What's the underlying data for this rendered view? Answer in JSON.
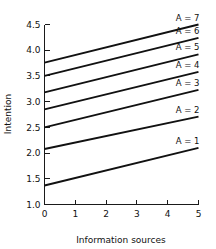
{
  "chart_data": {
    "type": "line",
    "title": "",
    "xlabel": "Information sources",
    "ylabel": "Intention",
    "xlim": [
      0,
      5
    ],
    "ylim": [
      1.0,
      4.5
    ],
    "grid": false,
    "legend_position": "inline-right-above-line-end",
    "xticks": [
      0,
      1,
      2,
      3,
      4,
      5
    ],
    "xtick_labels": [
      "0",
      "1",
      "2",
      "3",
      "4",
      "5"
    ],
    "yticks": [
      1.0,
      1.5,
      2.0,
      2.5,
      3.0,
      3.5,
      4.0,
      4.5
    ],
    "ytick_labels": [
      "1.0",
      "1.5",
      "2.0",
      "2.5",
      "3.0",
      "3.5",
      "4.0",
      "4.5"
    ],
    "x": [
      0,
      5
    ],
    "series": [
      {
        "name": "A = 1",
        "values": [
          1.37,
          2.1
        ]
      },
      {
        "name": "A = 2",
        "values": [
          2.08,
          2.71
        ]
      },
      {
        "name": "A = 3",
        "values": [
          2.5,
          3.23
        ]
      },
      {
        "name": "A = 4",
        "values": [
          2.85,
          3.58
        ]
      },
      {
        "name": "A = 5",
        "values": [
          3.18,
          3.92
        ]
      },
      {
        "name": "A = 6",
        "values": [
          3.5,
          4.24
        ]
      },
      {
        "name": "A = 7",
        "values": [
          3.76,
          4.5
        ]
      }
    ],
    "annotations": [
      {
        "text": "A = 7",
        "x": 5,
        "y": 4.5
      },
      {
        "text": "A = 6",
        "x": 5,
        "y": 4.24
      },
      {
        "text": "A = 5",
        "x": 5,
        "y": 3.92
      },
      {
        "text": "A = 4",
        "x": 5,
        "y": 3.58
      },
      {
        "text": "A = 3",
        "x": 5,
        "y": 3.23
      },
      {
        "text": "A = 2",
        "x": 5,
        "y": 2.71
      },
      {
        "text": "A = 1",
        "x": 5,
        "y": 2.1
      }
    ],
    "colors": {
      "line": "#111111",
      "axis": "#1a1a1a",
      "text": "#111111",
      "background": "#ffffff"
    }
  }
}
